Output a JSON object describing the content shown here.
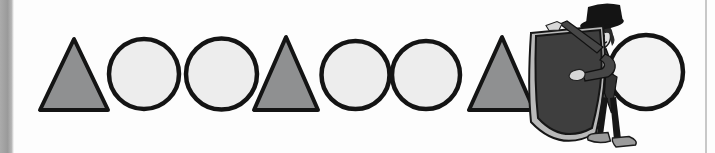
{
  "scene": {
    "background_color": "#fdfdfd",
    "left_bar_color": "#9a9a9a",
    "right_edge_line_color": "#c8c8c8"
  },
  "pattern": {
    "sequence_visible": [
      "triangle",
      "circle",
      "circle",
      "triangle",
      "circle",
      "circle",
      "triangle",
      "circle"
    ],
    "outline_color": "#141414",
    "triangle_fill": "#8f9091",
    "circle_fill": "#ededed",
    "last_circle_fill": "#f3f3f3",
    "shapes": [
      {
        "type": "triangle",
        "points": "74,39 40,110 108,110",
        "fill": "#8f9091"
      },
      {
        "type": "circle",
        "cx": 144,
        "cy": 74,
        "r": 35,
        "fill": "#ededed"
      },
      {
        "type": "circle",
        "cx": 221.5,
        "cy": 74,
        "r": 35.5,
        "fill": "#ededed"
      },
      {
        "type": "triangle",
        "points": "286,37 254,110 318,110",
        "fill": "#8f9091"
      },
      {
        "type": "circle",
        "cx": 355.5,
        "cy": 75,
        "r": 34,
        "fill": "#ededed"
      },
      {
        "type": "circle",
        "cx": 426,
        "cy": 75,
        "r": 34,
        "fill": "#ededed"
      },
      {
        "type": "triangle",
        "points": "502,37 469,110 534,110",
        "fill": "#8f9091"
      },
      {
        "type": "circle",
        "cx": 646,
        "cy": 72,
        "r": 37,
        "fill": "#f3f3f3"
      }
    ]
  },
  "magician": {
    "cloth_color": "#3e3e3e",
    "cloth_lining_color": "#b9b9b9",
    "hat_color": "#141414",
    "hair_color": "#2b2b2b",
    "suit_color": "#464646",
    "skin_color": "#dedede",
    "shoe_color": "#9b9b9b"
  }
}
